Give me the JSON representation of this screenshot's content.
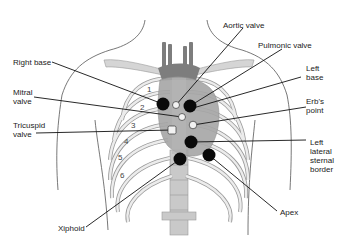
{
  "figure": {
    "labels": {
      "right_base": "Right base",
      "mitral_valve": "Mitral\nvalve",
      "tricuspid_valve": "Tricuspid\nvalve",
      "xiphoid": "Xiphoid",
      "aortic_valve": "Aortic valve",
      "pulmonic_valve": "Pulmonic valve",
      "left_base": "Left\nbase",
      "erbs_point": "Erb's\npoint",
      "left_lateral_sternal_border": "Left\nlateral\nsternal\nborder",
      "apex": "Apex"
    },
    "rib_numbers": [
      "1",
      "2",
      "3",
      "4",
      "5",
      "6"
    ],
    "colors": {
      "outline": "#444444",
      "rib_fill": "#e6e6e6",
      "rib_stroke": "#9a9a9a",
      "heart": "#9e9e9e",
      "vessels": "#7a7a7a",
      "dot": "#0a0a0a",
      "valve": "#f2f2f2"
    }
  }
}
